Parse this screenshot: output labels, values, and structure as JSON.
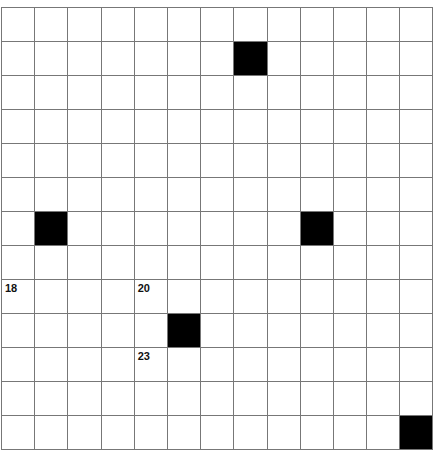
{
  "puzzle": {
    "rows": 13,
    "cols": 13,
    "colors": {
      "cell": "#ffffff",
      "block": "#000000",
      "line": "#777777"
    },
    "black_cells": [
      [
        1,
        7
      ],
      [
        6,
        1
      ],
      [
        6,
        9
      ],
      [
        9,
        5
      ],
      [
        12,
        12
      ]
    ],
    "numbers": [
      {
        "row": 8,
        "col": 0,
        "label": "18"
      },
      {
        "row": 8,
        "col": 4,
        "label": "20"
      },
      {
        "row": 10,
        "col": 4,
        "label": "23"
      }
    ]
  }
}
